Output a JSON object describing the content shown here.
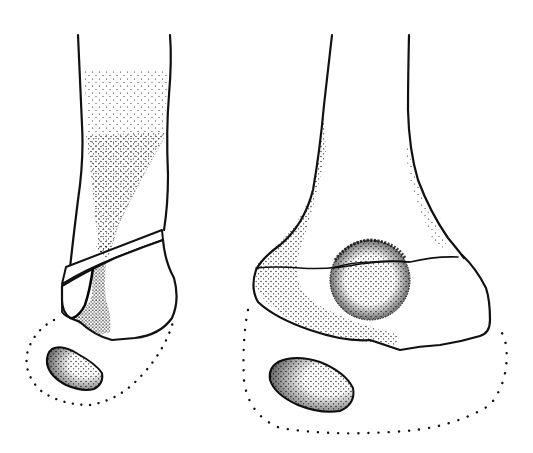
{
  "figure": {
    "type": "anatomical line drawing",
    "background": "#ffffff",
    "ink_color": "#111111",
    "views": [
      {
        "id": "left-view",
        "description": "distal bone, lateral view with oblique fracture line and stippled shaft fragment",
        "elements": [
          "bone-shaft-outline",
          "oblique-fracture-band",
          "distal-fragment",
          "stippled-wedge",
          "dotted-soft-tissue-outline",
          "ossicle"
        ]
      },
      {
        "id": "right-view",
        "description": "distal bone, frontal view with horizontal physis line, stippled round lesion and ossicle",
        "elements": [
          "bone-shaft-outline",
          "growth-plate-line",
          "round-lesion",
          "dotted-soft-tissue-outline",
          "ossicle"
        ]
      }
    ]
  }
}
